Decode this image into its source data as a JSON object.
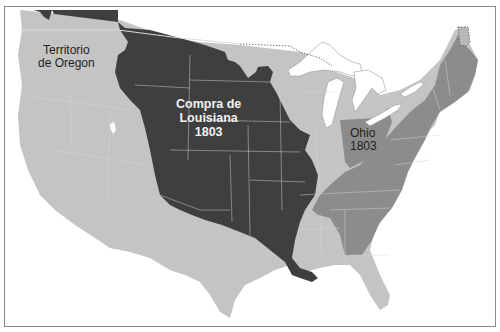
{
  "map": {
    "title": "",
    "colors": {
      "background": "#ffffff",
      "frame": "#8a8a8a",
      "water": "#ffffff",
      "us_territory_1783": "#c4c4c4",
      "original_states": "#8c8c8c",
      "louisiana_purchase": "#3f3f3f",
      "ohio": "#8c8c8c",
      "british_canada": "#3f3f3f",
      "state_borders": "#d6d6d6"
    },
    "regions": [
      {
        "id": "oregon",
        "label_lines": [
          "Territorio",
          "de Oregon"
        ]
      },
      {
        "id": "louisiana",
        "label_lines": [
          "Compra de",
          "Louisiana",
          "1803"
        ]
      },
      {
        "id": "ohio",
        "label_lines": [
          "Ohio",
          "1803"
        ]
      }
    ],
    "labels": {
      "oregon_line1": "Territorio",
      "oregon_line2": "de Oregon",
      "louisiana_line1": "Compra de",
      "louisiana_line2": "Louisiana",
      "louisiana_line3": "1803",
      "ohio_line1": "Ohio",
      "ohio_line2": "1803"
    }
  }
}
